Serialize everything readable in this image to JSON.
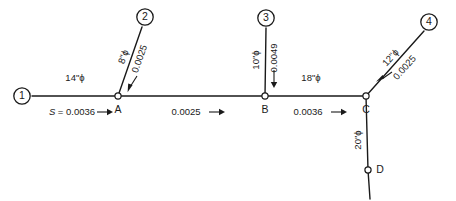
{
  "figure": {
    "type": "pipe-network-schematic",
    "title": "",
    "colors": {
      "line": "#1a1a1a",
      "background": "#ffffff"
    }
  },
  "nodes": [
    {
      "id": "n1",
      "label": "1",
      "kind": "manhole-numbered",
      "x": 22,
      "y": 96
    },
    {
      "id": "n2",
      "label": "2",
      "kind": "manhole-numbered",
      "x": 145,
      "y": 17
    },
    {
      "id": "n3",
      "label": "3",
      "kind": "manhole-numbered",
      "x": 266,
      "y": 18
    },
    {
      "id": "n4",
      "label": "4",
      "kind": "manhole-numbered",
      "x": 429,
      "y": 22
    },
    {
      "id": "nA",
      "label": "A",
      "kind": "junction",
      "x": 118,
      "y": 96
    },
    {
      "id": "nB",
      "label": "B",
      "kind": "junction",
      "x": 265,
      "y": 96
    },
    {
      "id": "nC",
      "label": "C",
      "kind": "junction",
      "x": 366,
      "y": 96
    },
    {
      "id": "nD",
      "label": "D",
      "kind": "junction",
      "x": 368,
      "y": 170
    }
  ],
  "segments": [
    {
      "id": "seg-1-A",
      "from": "1",
      "to": "A",
      "diameter": "14\"ϕ",
      "slope_label": "S = 0.0036",
      "slope_value": 0.0036,
      "flow_direction": "right"
    },
    {
      "id": "seg-2-A",
      "from": "2",
      "to": "A",
      "diameter": "8\"ϕ",
      "slope_label": "0.0025",
      "slope_value": 0.0025,
      "flow_direction": "down-left"
    },
    {
      "id": "seg-A-B",
      "from": "A",
      "to": "B",
      "diameter": "",
      "slope_label": "0.0025",
      "slope_value": 0.0025,
      "flow_direction": "right"
    },
    {
      "id": "seg-3-B",
      "from": "3",
      "to": "B",
      "diameter": "10\"ϕ",
      "slope_label": "0.0049",
      "slope_value": 0.0049,
      "flow_direction": "down"
    },
    {
      "id": "seg-B-C",
      "from": "B",
      "to": "C",
      "diameter": "18\"ϕ",
      "slope_label": "0.0036",
      "slope_value": 0.0036,
      "flow_direction": "right"
    },
    {
      "id": "seg-4-C",
      "from": "4",
      "to": "C",
      "diameter": "12\"ϕ",
      "slope_label": "0.0025",
      "slope_value": 0.0025,
      "flow_direction": "down-left"
    },
    {
      "id": "seg-C-D",
      "from": "C",
      "to": "D",
      "diameter": "20\"ϕ",
      "slope_label": "",
      "slope_value": null,
      "flow_direction": "down"
    }
  ],
  "labels": {
    "diam_14": "14\"ϕ",
    "diam_8": "8\"ϕ",
    "diam_10": "10\"ϕ",
    "diam_18": "18\"ϕ",
    "diam_12": "12\"ϕ",
    "diam_20": "20\"ϕ",
    "slope_S_0036": "S = 0.0036",
    "slope_0025_branch2": "0.0025",
    "slope_0025_AB": "0.0025",
    "slope_0049": "0.0049",
    "slope_0036_BC": "0.0036",
    "slope_0025_branch4": "0.0025",
    "node_1": "1",
    "node_2": "2",
    "node_3": "3",
    "node_4": "4",
    "node_A": "A",
    "node_B": "B",
    "node_C": "C",
    "node_D": "D"
  }
}
